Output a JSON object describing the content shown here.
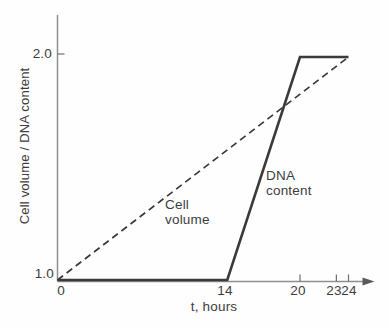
{
  "chart_data": {
    "type": "line",
    "title": "",
    "xlabel": "t, hours",
    "ylabel": "Cell volume / DNA content",
    "xlim": [
      0,
      24
    ],
    "ylim": [
      1.0,
      2.0
    ],
    "grid": false,
    "legend": "inline-annotations",
    "x_tick_labels": [
      "0",
      "14",
      "20",
      "23",
      "24"
    ],
    "x_tick_values": [
      0,
      14,
      20,
      23,
      24
    ],
    "x_axis_tick_marks": [
      20,
      23,
      24
    ],
    "y_tick_labels": [
      "1.0",
      "2.0"
    ],
    "y_tick_values": [
      1.0,
      2.0
    ],
    "y_axis_tick_marks": [
      2.0
    ],
    "series": [
      {
        "name": "Cell volume",
        "line_style": "dashed",
        "x": [
          0,
          24
        ],
        "y": [
          1.0,
          2.0
        ],
        "label_lines": [
          "Cell",
          "volume"
        ]
      },
      {
        "name": "DNA content",
        "line_style": "solid",
        "x": [
          0,
          14,
          20,
          24
        ],
        "y": [
          1.0,
          1.0,
          2.0,
          2.0
        ],
        "label_lines": [
          "DNA",
          "content"
        ]
      }
    ],
    "colors": {
      "line": "#3a3a3a",
      "axis": "#8f8f8f",
      "text": "#3d3d3d",
      "background": "#ffffff"
    }
  }
}
